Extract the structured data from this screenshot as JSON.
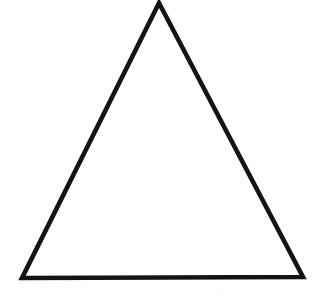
{
  "figure": {
    "shape_name": "triangle",
    "shape_kind": "equilateral-triangle-outline",
    "orientation": "apex-up",
    "background_color": "#ffffff",
    "stroke_color": "#141414",
    "fill_color": "none",
    "stroke_width": 4.6,
    "canvas": {
      "width": 325,
      "height": 308
    },
    "vertices": [
      {
        "name": "apex",
        "x": 159,
        "y": 3
      },
      {
        "name": "bottom-right",
        "x": 303,
        "y": 277
      },
      {
        "name": "bottom-left",
        "x": 22,
        "y": 278
      }
    ],
    "edges": [
      {
        "name": "left-edge",
        "from": "bottom-left",
        "to": "apex"
      },
      {
        "name": "right-edge",
        "from": "apex",
        "to": "bottom-right"
      },
      {
        "name": "base-edge",
        "from": "bottom-right",
        "to": "bottom-left"
      }
    ],
    "measurements": {
      "base_width_px": 281,
      "height_px": 275,
      "apex_offset_from_left_px": 137
    },
    "path_d": "M 159 3 L 303 277 L 22 278 Z",
    "labels": [],
    "annotations": []
  }
}
